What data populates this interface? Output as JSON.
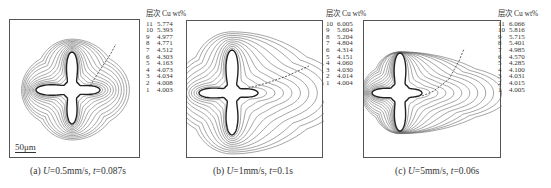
{
  "figure": {
    "panels": [
      {
        "id": "a",
        "caption_prefix": "(a) ",
        "caption_var1": "U",
        "caption_mid": "=0.5mm/s, ",
        "caption_var2": "t",
        "caption_end": "=0.087s",
        "legend_header": "层次 Cu wt%",
        "scale_label": "50μm"
      },
      {
        "id": "b",
        "caption_prefix": "(b) ",
        "caption_var1": "U",
        "caption_mid": "=1mm/s, ",
        "caption_var2": "t",
        "caption_end": "=0.1s",
        "legend_header": "层次 Cu wt%"
      },
      {
        "id": "c",
        "caption_prefix": "(c) ",
        "caption_var1": "U",
        "caption_mid": "=5mm/s, ",
        "caption_var2": "t",
        "caption_end": "=0.06s",
        "legend_header": "层次 Cu wt%"
      }
    ]
  },
  "chart_data": [
    {
      "type": "contour",
      "title": "(a) U=0.5mm/s, t=0.087s",
      "legend_columns": [
        "层次",
        "Cu wt%"
      ],
      "levels": [
        11,
        10,
        9,
        8,
        7,
        6,
        5,
        4,
        3,
        2,
        1
      ],
      "values": [
        5.774,
        5.393,
        4.977,
        4.771,
        4.512,
        4.303,
        4.163,
        4.073,
        4.034,
        4.008,
        4.003
      ],
      "scale_bar": "50μm",
      "contour_labels": [
        "1",
        "10"
      ]
    },
    {
      "type": "contour",
      "title": "(b) U=1mm/s, t=0.1s",
      "legend_columns": [
        "层次",
        "Cu wt%"
      ],
      "levels": [
        10,
        9,
        8,
        7,
        6,
        5,
        4,
        3,
        2,
        1
      ],
      "values": [
        6.005,
        5.604,
        5.204,
        4.804,
        4.314,
        4.151,
        4.06,
        4.03,
        4.014,
        4.004
      ],
      "contour_labels": [
        "10",
        "9",
        "8",
        "6"
      ]
    },
    {
      "type": "contour",
      "title": "(c) U=5mm/s, t=0.06s",
      "legend_columns": [
        "层次",
        "Cu wt%"
      ],
      "levels": [
        11,
        10,
        9,
        8,
        7,
        6,
        5,
        4,
        3,
        2,
        1
      ],
      "values": [
        6.066,
        5.816,
        5.715,
        5.401,
        4.985,
        4.57,
        4.285,
        4.1,
        4.031,
        4.015,
        4.005
      ],
      "contour_labels": [
        "1",
        "6",
        "8",
        "9",
        "10"
      ]
    }
  ]
}
